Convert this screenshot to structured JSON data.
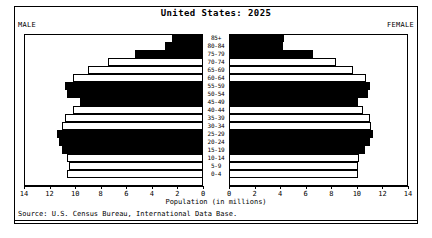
{
  "chart_data": {
    "type": "bar",
    "subtype": "population-pyramid",
    "title": "United States: 2025",
    "xlabel": "Population (in millions)",
    "ylabel": "",
    "source": "Source: U.S. Census Bureau, International Data Base.",
    "left_label": "MALE",
    "right_label": "FEMALE",
    "xlim": [
      0,
      14
    ],
    "xticks": [
      0,
      2,
      4,
      6,
      8,
      10,
      12,
      14
    ],
    "left_tick_labels": [
      "14",
      "12",
      "10",
      "8",
      "6",
      "4",
      "2",
      "0"
    ],
    "right_tick_labels": [
      "0",
      "2",
      "4",
      "6",
      "8",
      "10",
      "12",
      "14"
    ],
    "grid": false,
    "legend": "none",
    "categories": [
      "85+",
      "80-84",
      "75-79",
      "70-74",
      "65-69",
      "60-64",
      "55-59",
      "50-54",
      "45-49",
      "40-44",
      "35-39",
      "30-34",
      "25-29",
      "20-24",
      "15-19",
      "10-14",
      "5-9",
      "0-4"
    ],
    "series": [
      {
        "name": "MALE",
        "values": [
          2.4,
          3.0,
          5.3,
          7.4,
          9.0,
          10.2,
          10.8,
          10.6,
          9.6,
          10.2,
          10.8,
          11.0,
          11.4,
          11.3,
          11.0,
          10.6,
          10.5,
          10.6
        ]
      },
      {
        "name": "FEMALE",
        "values": [
          4.3,
          4.2,
          6.6,
          8.4,
          9.7,
          10.7,
          11.0,
          10.9,
          10.1,
          10.5,
          11.0,
          11.1,
          11.3,
          11.0,
          10.6,
          10.2,
          10.1,
          10.1
        ]
      }
    ],
    "bar_fills": [
      "dark",
      "dark",
      "dark",
      "light",
      "light",
      "light",
      "dark",
      "dark",
      "dark",
      "light",
      "light",
      "light",
      "dark",
      "dark",
      "dark",
      "light",
      "light",
      "light"
    ]
  }
}
